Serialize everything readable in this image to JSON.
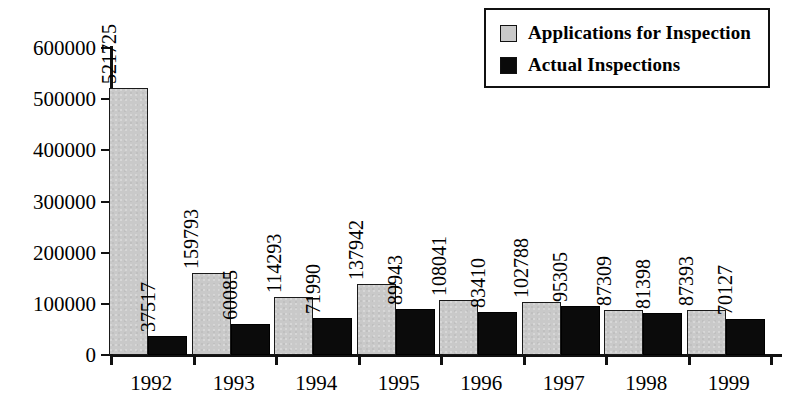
{
  "legend": {
    "position": "top-right",
    "entries": [
      {
        "label": "Applications for Inspection",
        "swatch": "gray-swatch-icon",
        "color": "#c9c9c9"
      },
      {
        "label": "Actual Inspections",
        "swatch": "black-swatch-icon",
        "color": "#0b0b0b"
      }
    ]
  },
  "chart_data": {
    "type": "bar",
    "title": "",
    "xlabel": "",
    "ylabel": "",
    "ylim": [
      0,
      600000
    ],
    "yticks": [
      0,
      100000,
      200000,
      300000,
      400000,
      500000,
      600000
    ],
    "ytick_labels": [
      "0",
      "100000",
      "200000",
      "300000",
      "400000",
      "500000",
      "600000"
    ],
    "grid": false,
    "legend_position": "top-right",
    "categories": [
      "1992",
      "1993",
      "1994",
      "1995",
      "1996",
      "1997",
      "1998",
      "1999"
    ],
    "series": [
      {
        "name": "Applications for Inspection",
        "color": "#c9c9c9",
        "values": [
          521725,
          159793,
          114293,
          137942,
          108041,
          102788,
          87309,
          87393
        ],
        "value_labels": [
          "521725",
          "159793",
          "114293",
          "137942",
          "108041",
          "102788",
          "87309",
          "87393"
        ]
      },
      {
        "name": "Actual Inspections",
        "color": "#0b0b0b",
        "values": [
          37517,
          60085,
          71990,
          89943,
          83410,
          95305,
          81398,
          70127
        ],
        "value_labels": [
          "37517",
          "60085",
          "71990",
          "89943",
          "83410",
          "95305",
          "81398",
          "70127"
        ]
      }
    ]
  }
}
